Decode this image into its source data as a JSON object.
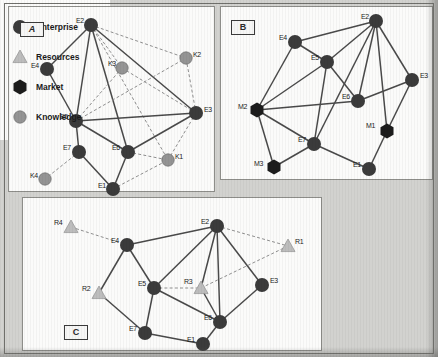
{
  "figure": {
    "panels": [
      {
        "id": "A",
        "tag": "A",
        "nodes": [
          {
            "id": "E2",
            "label": "E2",
            "type": "enterprise",
            "x": 82,
            "y": 18,
            "lx": -15,
            "ly": -4
          },
          {
            "id": "E4",
            "label": "E4",
            "type": "enterprise",
            "x": 38,
            "y": 62,
            "lx": -16,
            "ly": -3
          },
          {
            "id": "K3",
            "label": "K3",
            "type": "knowledge",
            "x": 113,
            "y": 61,
            "lx": -14,
            "ly": -4
          },
          {
            "id": "K2",
            "label": "K2",
            "type": "knowledge",
            "x": 177,
            "y": 51,
            "lx": 7,
            "ly": -3
          },
          {
            "id": "E3",
            "label": "E3",
            "type": "enterprise",
            "x": 187,
            "y": 106,
            "lx": 8,
            "ly": -3
          },
          {
            "id": "E5",
            "label": "E5",
            "type": "enterprise",
            "x": 67,
            "y": 114,
            "lx": -16,
            "ly": -4
          },
          {
            "id": "E6",
            "label": "E6",
            "type": "enterprise",
            "x": 119,
            "y": 145,
            "lx": -16,
            "ly": -4
          },
          {
            "id": "E7",
            "label": "E7",
            "type": "enterprise",
            "x": 70,
            "y": 145,
            "lx": -16,
            "ly": -4
          },
          {
            "id": "K1",
            "label": "K1",
            "type": "knowledge",
            "x": 159,
            "y": 153,
            "lx": 7,
            "ly": -3
          },
          {
            "id": "K4",
            "label": "K4",
            "type": "knowledge",
            "x": 36,
            "y": 172,
            "lx": -15,
            "ly": -3
          },
          {
            "id": "E1",
            "label": "E1",
            "type": "enterprise",
            "x": 104,
            "y": 182,
            "lx": -15,
            "ly": -3
          }
        ],
        "edges": [
          {
            "a": "E2",
            "b": "E4",
            "style": "solid"
          },
          {
            "a": "E2",
            "b": "E5",
            "style": "solid"
          },
          {
            "a": "E2",
            "b": "E6",
            "style": "solid"
          },
          {
            "a": "E2",
            "b": "E3",
            "style": "solid"
          },
          {
            "a": "E2",
            "b": "K3",
            "style": "dashed"
          },
          {
            "a": "E2",
            "b": "K2",
            "style": "dashed"
          },
          {
            "a": "E2",
            "b": "K1",
            "style": "dashed"
          },
          {
            "a": "E4",
            "b": "E5",
            "style": "solid"
          },
          {
            "a": "E5",
            "b": "E6",
            "style": "solid"
          },
          {
            "a": "E5",
            "b": "E3",
            "style": "solid"
          },
          {
            "a": "E5",
            "b": "K2",
            "style": "dashed"
          },
          {
            "a": "E5",
            "b": "K3",
            "style": "dashed"
          },
          {
            "a": "E5",
            "b": "E7",
            "style": "solid"
          },
          {
            "a": "E6",
            "b": "E3",
            "style": "solid"
          },
          {
            "a": "E6",
            "b": "K1",
            "style": "dashed"
          },
          {
            "a": "E6",
            "b": "E1",
            "style": "solid"
          },
          {
            "a": "E3",
            "b": "K2",
            "style": "dashed"
          },
          {
            "a": "E3",
            "b": "K1",
            "style": "dashed"
          },
          {
            "a": "E7",
            "b": "K4",
            "style": "dashed"
          },
          {
            "a": "E7",
            "b": "E1",
            "style": "solid"
          },
          {
            "a": "E1",
            "b": "K1",
            "style": "dashed"
          },
          {
            "a": "K3",
            "b": "E3",
            "style": "dashed"
          }
        ]
      },
      {
        "id": "B",
        "tag": "B",
        "nodes": [
          {
            "id": "E2",
            "label": "E2",
            "type": "enterprise",
            "x": 155,
            "y": 14,
            "lx": -15,
            "ly": -4
          },
          {
            "id": "E4",
            "label": "E4",
            "type": "enterprise",
            "x": 74,
            "y": 35,
            "lx": -16,
            "ly": -4
          },
          {
            "id": "E5",
            "label": "E5",
            "type": "enterprise",
            "x": 106,
            "y": 55,
            "lx": -16,
            "ly": -4
          },
          {
            "id": "E3",
            "label": "E3",
            "type": "enterprise",
            "x": 191,
            "y": 73,
            "lx": 8,
            "ly": -4
          },
          {
            "id": "E6",
            "label": "E6",
            "type": "enterprise",
            "x": 137,
            "y": 94,
            "lx": -16,
            "ly": -4
          },
          {
            "id": "M2",
            "label": "M2",
            "type": "market",
            "x": 36,
            "y": 103,
            "lx": -19,
            "ly": -3
          },
          {
            "id": "M1",
            "label": "M1",
            "type": "market",
            "x": 166,
            "y": 124,
            "lx": -21,
            "ly": -5
          },
          {
            "id": "E7",
            "label": "E7",
            "type": "enterprise",
            "x": 93,
            "y": 137,
            "lx": -16,
            "ly": -4
          },
          {
            "id": "M3",
            "label": "M3",
            "type": "market",
            "x": 53,
            "y": 160,
            "lx": -20,
            "ly": -3
          },
          {
            "id": "E1",
            "label": "E1",
            "type": "enterprise",
            "x": 148,
            "y": 162,
            "lx": -16,
            "ly": -4
          }
        ],
        "edges": [
          {
            "a": "E2",
            "b": "E4",
            "style": "solid"
          },
          {
            "a": "E2",
            "b": "E5",
            "style": "solid"
          },
          {
            "a": "E2",
            "b": "E3",
            "style": "solid"
          },
          {
            "a": "E2",
            "b": "E6",
            "style": "solid"
          },
          {
            "a": "E2",
            "b": "E7",
            "style": "solid"
          },
          {
            "a": "E2",
            "b": "M1",
            "style": "solid"
          },
          {
            "a": "E4",
            "b": "E5",
            "style": "solid"
          },
          {
            "a": "E4",
            "b": "M2",
            "style": "solid"
          },
          {
            "a": "E5",
            "b": "M2",
            "style": "solid"
          },
          {
            "a": "E5",
            "b": "E6",
            "style": "solid"
          },
          {
            "a": "E5",
            "b": "E7",
            "style": "solid"
          },
          {
            "a": "E3",
            "b": "E6",
            "style": "solid"
          },
          {
            "a": "E3",
            "b": "M1",
            "style": "solid"
          },
          {
            "a": "E6",
            "b": "M2",
            "style": "solid"
          },
          {
            "a": "M2",
            "b": "E7",
            "style": "solid"
          },
          {
            "a": "M2",
            "b": "M3",
            "style": "solid"
          },
          {
            "a": "M3",
            "b": "E7",
            "style": "solid"
          },
          {
            "a": "E7",
            "b": "E1",
            "style": "solid"
          },
          {
            "a": "E1",
            "b": "M1",
            "style": "solid"
          }
        ]
      },
      {
        "id": "C",
        "tag": "C",
        "nodes": [
          {
            "id": "R4",
            "label": "R4",
            "type": "resource",
            "x": 48,
            "y": 29,
            "lx": -17,
            "ly": -4
          },
          {
            "id": "E4",
            "label": "E4",
            "type": "enterprise",
            "x": 104,
            "y": 47,
            "lx": -16,
            "ly": -4
          },
          {
            "id": "E2",
            "label": "E2",
            "type": "enterprise",
            "x": 194,
            "y": 28,
            "lx": -16,
            "ly": -4
          },
          {
            "id": "R1",
            "label": "R1",
            "type": "resource",
            "x": 265,
            "y": 48,
            "lx": 7,
            "ly": -4
          },
          {
            "id": "E5",
            "label": "E5",
            "type": "enterprise",
            "x": 131,
            "y": 90,
            "lx": -16,
            "ly": -4
          },
          {
            "id": "R3",
            "label": "R3",
            "type": "resource",
            "x": 178,
            "y": 90,
            "lx": -17,
            "ly": -6
          },
          {
            "id": "E3",
            "label": "E3",
            "type": "enterprise",
            "x": 239,
            "y": 87,
            "lx": 8,
            "ly": -4
          },
          {
            "id": "R2",
            "label": "R2",
            "type": "resource",
            "x": 76,
            "y": 95,
            "lx": -17,
            "ly": -4
          },
          {
            "id": "E6",
            "label": "E6",
            "type": "enterprise",
            "x": 197,
            "y": 124,
            "lx": -16,
            "ly": -4
          },
          {
            "id": "E7",
            "label": "E7",
            "type": "enterprise",
            "x": 122,
            "y": 135,
            "lx": -16,
            "ly": -4
          },
          {
            "id": "E1",
            "label": "E1",
            "type": "enterprise",
            "x": 180,
            "y": 146,
            "lx": -16,
            "ly": -4
          }
        ],
        "edges": [
          {
            "a": "R4",
            "b": "E4",
            "style": "dashed"
          },
          {
            "a": "E4",
            "b": "E2",
            "style": "solid"
          },
          {
            "a": "E4",
            "b": "E5",
            "style": "solid"
          },
          {
            "a": "E4",
            "b": "R2",
            "style": "solid"
          },
          {
            "a": "E2",
            "b": "R1",
            "style": "dashed"
          },
          {
            "a": "E2",
            "b": "E5",
            "style": "solid"
          },
          {
            "a": "E2",
            "b": "E3",
            "style": "solid"
          },
          {
            "a": "E2",
            "b": "E6",
            "style": "solid"
          },
          {
            "a": "E2",
            "b": "R3",
            "style": "solid"
          },
          {
            "a": "E5",
            "b": "R3",
            "style": "dashed"
          },
          {
            "a": "E5",
            "b": "E6",
            "style": "solid"
          },
          {
            "a": "E5",
            "b": "E7",
            "style": "solid"
          },
          {
            "a": "E3",
            "b": "E6",
            "style": "solid"
          },
          {
            "a": "R3",
            "b": "E6",
            "style": "solid"
          },
          {
            "a": "R3",
            "b": "R1",
            "style": "dashed"
          },
          {
            "a": "R2",
            "b": "E7",
            "style": "solid"
          },
          {
            "a": "E7",
            "b": "E1",
            "style": "solid"
          },
          {
            "a": "E1",
            "b": "E6",
            "style": "solid"
          }
        ]
      }
    ]
  },
  "legend": {
    "items": [
      {
        "label": "Enterprise",
        "shape": "enterprise-circle-icon",
        "type": "enterprise",
        "color": "#3a3a3a"
      },
      {
        "label": "Resources",
        "shape": "resource-triangle-icon",
        "type": "resource",
        "color": "#b5b5b5"
      },
      {
        "label": "Market",
        "shape": "market-hexagon-icon",
        "type": "market",
        "color": "#1d1d1d"
      },
      {
        "label": "Knowledge",
        "shape": "knowledge-circle-icon",
        "type": "knowledge",
        "color": "#8e8e8e"
      }
    ]
  },
  "colors": {
    "enterprise": "#3b3b3b",
    "resource": "#bdbdbd",
    "market": "#1c1c1c",
    "knowledge": "#949494",
    "edge_solid": "#4a4a4a",
    "edge_dashed": "#8f8f8f",
    "panel_bg": "#fbfbfa",
    "page_bg": "#d2d2cf"
  }
}
